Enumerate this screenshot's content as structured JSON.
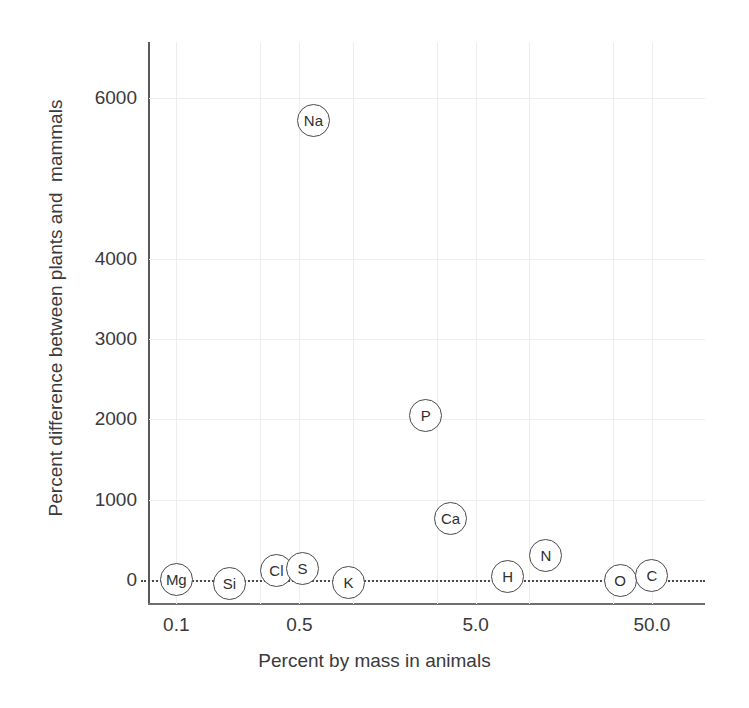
{
  "figure": {
    "top_remnant_text": "",
    "background_color": "#ffffff"
  },
  "chart_data": {
    "type": "scatter",
    "title": "",
    "xlabel": "Percent by mass in animals",
    "ylabel": "Percent difference between plants and  mammals",
    "xscale": "log",
    "yscale": "linear",
    "xlim": [
      0.07,
      100.0
    ],
    "ylim": [
      -300,
      6700
    ],
    "grid": true,
    "legend": null,
    "zero_reference_line": {
      "value": 0,
      "style": "dotted",
      "color": "#4c4c4e"
    },
    "xticks": [
      0.1,
      0.5,
      5.0,
      50.0
    ],
    "xtick_labels": [
      "0.1",
      "0.5",
      "5.0",
      "50.0"
    ],
    "yticks": [
      0,
      1000,
      2000,
      3000,
      4000,
      6000
    ],
    "ytick_labels": [
      "0",
      "1000",
      "2000",
      "3000",
      "4000",
      "6000"
    ],
    "point_label_field": "element",
    "points": [
      {
        "element": "Mg",
        "x": 0.1,
        "y": 0
      },
      {
        "element": "Si",
        "x": 0.2,
        "y": -40
      },
      {
        "element": "Cl",
        "x": 0.37,
        "y": 120
      },
      {
        "element": "S",
        "x": 0.52,
        "y": 140
      },
      {
        "element": "K",
        "x": 0.95,
        "y": -30
      },
      {
        "element": "Na",
        "x": 0.6,
        "y": 5720
      },
      {
        "element": "P",
        "x": 2.6,
        "y": 2050
      },
      {
        "element": "Ca",
        "x": 3.6,
        "y": 760
      },
      {
        "element": "H",
        "x": 7.6,
        "y": 40
      },
      {
        "element": "N",
        "x": 12.5,
        "y": 310
      },
      {
        "element": "O",
        "x": 33.0,
        "y": -10
      },
      {
        "element": "C",
        "x": 50.0,
        "y": 50
      }
    ]
  },
  "colors": {
    "axis": "#58585a",
    "grid": "#ededf0",
    "text": "#3a3a3c",
    "bubble_stroke": "#4a4a4c",
    "bubble_fill": "#ffffff"
  }
}
